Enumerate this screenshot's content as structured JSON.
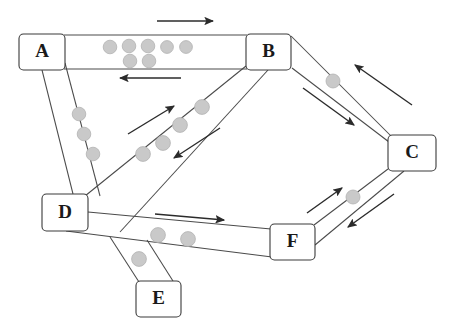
{
  "diagram": {
    "type": "node-link-diagram",
    "width": 451,
    "height": 336,
    "background_color": "#ffffff",
    "colors": {
      "node_stroke": "#3a3a3a",
      "node_fill": "#ffffff",
      "node_label": "#1a1a1a",
      "corridor_line": "#4a4a4a",
      "arrow": "#2b2b2b",
      "token_fill": "#c9c9c9",
      "token_stroke": "#b2b2b2"
    },
    "nodes": [
      {
        "id": "A",
        "label": "A",
        "x": 19,
        "y": 34,
        "w": 46,
        "h": 36,
        "cx": 42,
        "cy": 52
      },
      {
        "id": "B",
        "label": "B",
        "x": 246,
        "y": 34,
        "w": 45,
        "h": 36,
        "cx": 268.5,
        "cy": 52
      },
      {
        "id": "C",
        "label": "C",
        "x": 388,
        "y": 135,
        "w": 48,
        "h": 36,
        "cx": 412,
        "cy": 153
      },
      {
        "id": "D",
        "label": "D",
        "x": 42,
        "y": 194,
        "w": 46,
        "h": 37,
        "cx": 65,
        "cy": 212.5
      },
      {
        "id": "E",
        "label": "E",
        "x": 136,
        "y": 281,
        "w": 45,
        "h": 36,
        "cx": 158.5,
        "cy": 299
      },
      {
        "id": "F",
        "label": "F",
        "x": 270,
        "y": 224,
        "w": 45,
        "h": 36,
        "cx": 292.5,
        "cy": 242
      }
    ],
    "corridors": [
      {
        "id": "A-B",
        "from": "A",
        "to": "B",
        "token_count": 7
      },
      {
        "id": "B-C",
        "from": "B",
        "to": "C",
        "token_count": 1
      },
      {
        "id": "C-F",
        "from": "C",
        "to": "F",
        "token_count": 1
      },
      {
        "id": "D-F",
        "from": "D",
        "to": "F",
        "token_count": 2
      },
      {
        "id": "D-B",
        "from": "D",
        "to": "B",
        "token_count": 4
      },
      {
        "id": "A-D",
        "from": "A",
        "to": "D",
        "token_count": 3
      },
      {
        "id": "D-E",
        "from": "D",
        "to": "E",
        "token_count": 1
      }
    ],
    "tokens": [
      {
        "corridor": "A-B",
        "cx": 110,
        "cy": 47,
        "r": 6.8
      },
      {
        "corridor": "A-B",
        "cx": 129,
        "cy": 46,
        "r": 6.8
      },
      {
        "corridor": "A-B",
        "cx": 148,
        "cy": 46,
        "r": 6.8
      },
      {
        "corridor": "A-B",
        "cx": 167,
        "cy": 47,
        "r": 6.4
      },
      {
        "corridor": "A-B",
        "cx": 186,
        "cy": 47,
        "r": 6.4
      },
      {
        "corridor": "A-B",
        "cx": 130,
        "cy": 61,
        "r": 6.8
      },
      {
        "corridor": "A-B",
        "cx": 149,
        "cy": 61,
        "r": 6.8
      },
      {
        "corridor": "A-D",
        "cx": 79,
        "cy": 114,
        "r": 6.8
      },
      {
        "corridor": "A-D",
        "cx": 84,
        "cy": 134,
        "r": 6.8
      },
      {
        "corridor": "A-D",
        "cx": 93,
        "cy": 154,
        "r": 6.8
      },
      {
        "corridor": "D-B",
        "cx": 143,
        "cy": 154,
        "r": 7.4
      },
      {
        "corridor": "D-B",
        "cx": 163,
        "cy": 143,
        "r": 7.4
      },
      {
        "corridor": "D-B",
        "cx": 180,
        "cy": 125,
        "r": 7.4
      },
      {
        "corridor": "D-B",
        "cx": 202,
        "cy": 107,
        "r": 7.4
      },
      {
        "corridor": "B-C",
        "cx": 333,
        "cy": 81,
        "r": 7.0
      },
      {
        "corridor": "C-F",
        "cx": 353,
        "cy": 197,
        "r": 7.0
      },
      {
        "corridor": "D-F",
        "cx": 158,
        "cy": 235,
        "r": 7.4
      },
      {
        "corridor": "D-F",
        "cx": 188,
        "cy": 239,
        "r": 7.4
      },
      {
        "corridor": "D-E",
        "cx": 139,
        "cy": 259,
        "r": 7.4
      }
    ],
    "flow_arrows": [
      {
        "id": "A-to-B-outbound",
        "direction": "right",
        "x1": 157,
        "y1": 21,
        "x2": 216,
        "y2": 21
      },
      {
        "id": "B-to-A-return",
        "direction": "left",
        "x1": 181,
        "y1": 78,
        "x2": 117,
        "y2": 78
      },
      {
        "id": "D-to-B-outbound",
        "direction": "up-right",
        "x1": 128,
        "y1": 134,
        "x2": 176,
        "y2": 105
      },
      {
        "id": "B-to-D-return",
        "direction": "down-left",
        "x1": 220,
        "y1": 128,
        "x2": 172,
        "y2": 159
      },
      {
        "id": "B-to-C-outbound",
        "direction": "down-right",
        "x1": 303,
        "y1": 88,
        "x2": 356,
        "y2": 126
      },
      {
        "id": "C-to-B-return",
        "direction": "up-left",
        "x1": 412,
        "y1": 105,
        "x2": 353,
        "y2": 64
      },
      {
        "id": "F-to-C-outbound",
        "direction": "up-right",
        "x1": 307,
        "y1": 213,
        "x2": 344,
        "y2": 187
      },
      {
        "id": "C-to-F-return",
        "direction": "down-left",
        "x1": 394,
        "y1": 194,
        "x2": 346,
        "y2": 228
      },
      {
        "id": "D-to-F-outbound",
        "direction": "right",
        "x1": 155,
        "y1": 214,
        "x2": 227,
        "y2": 220
      }
    ]
  }
}
